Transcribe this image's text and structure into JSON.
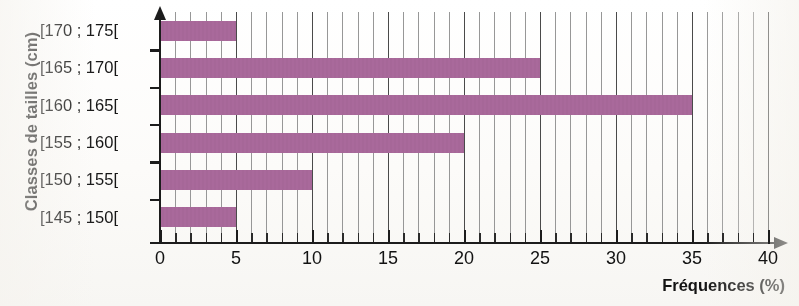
{
  "chart_data": {
    "type": "bar",
    "orientation": "horizontal",
    "title": "",
    "xlabel": "Fréquences (%)",
    "ylabel": "Classes de tailles (cm)",
    "categories": [
      "[170 ; 175[",
      "[165 ; 170[",
      "[160 ; 165[",
      "[155 ; 160[",
      "[150 ; 155[",
      "[145 ; 150["
    ],
    "values": [
      5,
      25,
      35,
      20,
      10,
      5
    ],
    "xlim": [
      0,
      40
    ],
    "xticks": [
      0,
      5,
      10,
      15,
      20,
      25,
      30,
      35,
      40
    ],
    "xtick_labels": [
      "0",
      "5",
      "10",
      "15",
      "20",
      "25",
      "30",
      "35",
      "40"
    ],
    "minor_tick_step": 1,
    "grid": "vertical-minor-and-major",
    "legend": "none",
    "bar_color": "#a9699b",
    "axis_color": "#1c1c1c",
    "gridline_color": "#7b7b7b"
  },
  "axes": {
    "x_title": "Fréquences (%)",
    "y_title": "Classes de tailles (cm)"
  }
}
